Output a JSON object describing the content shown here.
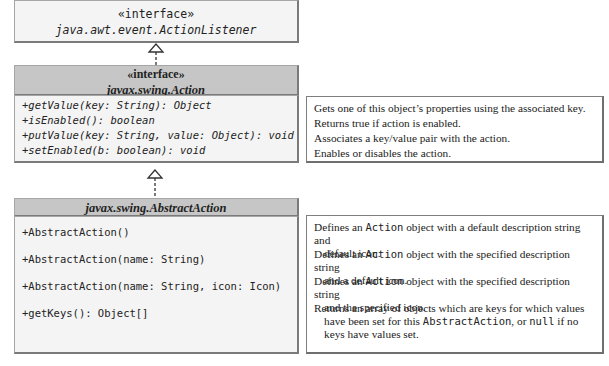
{
  "diagram": {
    "type": "uml-class-diagram",
    "classes": [
      {
        "id": "action-listener",
        "stereotype": "«interface»",
        "name": "java.awt.event.ActionListener",
        "members": []
      },
      {
        "id": "action",
        "stereotype": "«interface»",
        "name": "javax.swing.Action",
        "members": [
          "+getValue(key: String): Object",
          "+isEnabled(): boolean",
          "+putValue(key: String, value: Object): void",
          "+setEnabled(b: boolean): void"
        ]
      },
      {
        "id": "abstract-action",
        "name": "javax.swing.AbstractAction",
        "members": [
          "+AbstractAction()",
          "+AbstractAction(name: String)",
          "+AbstractAction(name: String, icon: Icon)",
          "+getKeys(): Object[]"
        ]
      }
    ],
    "relationships": [
      {
        "from": "action",
        "to": "action-listener",
        "type": "interface-extends (dashed, hollow arrow)"
      },
      {
        "from": "abstract-action",
        "to": "action",
        "type": "implements (dashed, hollow arrow)"
      }
    ],
    "notes": {
      "action": [
        "Gets one of this object’s properties using the associated key.",
        "Returns true if action is enabled.",
        "Associates a key/value pair with the action.",
        "Enables or disables the action."
      ],
      "abstract_action": [
        {
          "pre": "Defines an ",
          "code": "Action",
          "post": " object with a default description string and",
          "cont": "default icon."
        },
        {
          "pre": "Defines an ",
          "code": "Action",
          "post": " object with the specified description string",
          "cont": "and a default icon."
        },
        {
          "pre": "Defines an ",
          "code": "Action",
          "post": " object with the specified description string",
          "cont": "and the specified icon."
        },
        {
          "line1": "Returns an array of objects which are keys for which values",
          "line2_pre": "have been set for this ",
          "line2_code": "AbstractAction",
          "line2_mid": ", or ",
          "line2_code2": "null",
          "line2_post": " if no",
          "line3": "keys have values set."
        }
      ]
    },
    "colors": {
      "header_gray": "#c6c6c6",
      "body_light": "#f4f4f4",
      "border": "#7a7a7a",
      "text": "#222222"
    }
  }
}
